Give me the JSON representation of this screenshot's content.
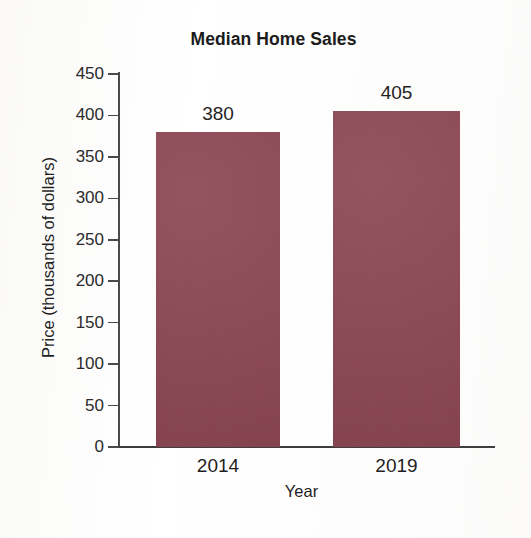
{
  "chart_data": {
    "type": "bar",
    "title": "Median Home Sales",
    "xlabel": "Year",
    "ylabel": "Price (thousands of dollars)",
    "categories": [
      "2014",
      "2019"
    ],
    "values": [
      380,
      405
    ],
    "data_labels": [
      "380",
      "405"
    ],
    "ylim": [
      0,
      450
    ],
    "yticks": [
      0,
      50,
      100,
      150,
      200,
      250,
      300,
      350,
      400,
      450
    ],
    "ytick_labels": [
      "0",
      "50",
      "100",
      "150",
      "200",
      "250",
      "300",
      "350",
      "400",
      "450"
    ],
    "grid": false,
    "legend": false,
    "bar_color": "#8e4250",
    "axis_color": "#3d3d3d",
    "text_color": "#1f1f1f",
    "background": "#fefefe"
  }
}
